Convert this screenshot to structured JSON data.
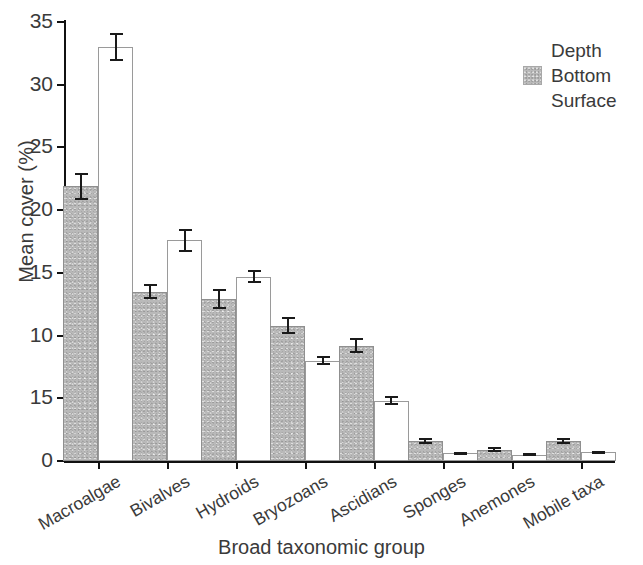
{
  "chart_data": {
    "type": "bar",
    "title": "",
    "xlabel": "Broad taxonomic group",
    "ylabel": "Mean cover (%)",
    "ylim": [
      0,
      35
    ],
    "ytick_labels": [
      "35",
      "30",
      "25",
      "20",
      "15",
      "10",
      "15",
      "0"
    ],
    "ytick_values": [
      35,
      30,
      25,
      20,
      15,
      10,
      5,
      0
    ],
    "grid": false,
    "legend_position": "top-right",
    "legend_title": "Depth",
    "categories": [
      "Macroalgae",
      "Bivalves",
      "Hydroids",
      "Bryozoans",
      "Ascidians",
      "Sponges",
      "Anemones",
      "Mobile taxa"
    ],
    "series": [
      {
        "name": "Bottom",
        "color": "#b9b9b9",
        "values": [
          21.9,
          13.5,
          12.9,
          10.8,
          9.2,
          1.6,
          0.9,
          1.6
        ],
        "errors": [
          1.1,
          0.6,
          0.8,
          0.7,
          0.6,
          0.25,
          0.2,
          0.25
        ]
      },
      {
        "name": "Surface",
        "color": "#ffffff",
        "values": [
          33.0,
          17.6,
          14.7,
          8.0,
          4.8,
          0.6,
          0.5,
          0.7
        ],
        "errors": [
          1.1,
          0.9,
          0.5,
          0.35,
          0.35,
          0.12,
          0.1,
          0.12
        ]
      }
    ]
  },
  "legend": {
    "title": "Depth",
    "entries": [
      {
        "label": "Bottom",
        "swatch": "gray-textured"
      },
      {
        "label": "Surface",
        "swatch": "white-open"
      }
    ]
  },
  "axes": {
    "y_title": "Mean cover (%)",
    "x_title": "Broad taxonomic group"
  }
}
